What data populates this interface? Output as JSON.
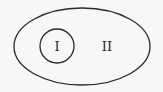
{
  "diagram": {
    "type": "venn-subset",
    "outer_set": {
      "label": "II",
      "shape": "ellipse"
    },
    "inner_set": {
      "label": "I",
      "shape": "circle"
    },
    "colors": {
      "stroke": "#2a2a2a",
      "background": "#f7f7f5"
    }
  }
}
